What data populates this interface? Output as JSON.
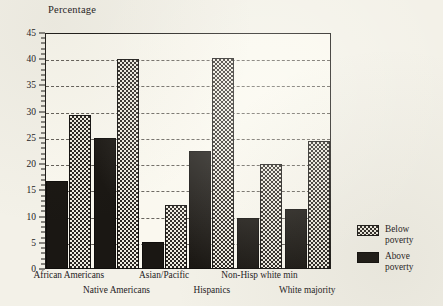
{
  "chart_data": {
    "type": "bar",
    "title": "Percentage",
    "xlabel": "",
    "ylabel": "Percentage",
    "ylim": [
      0,
      45
    ],
    "ytick_step": 5,
    "yticks": [
      0,
      5,
      10,
      15,
      20,
      25,
      30,
      35,
      40,
      45
    ],
    "ytick_labels": [
      "0",
      "5",
      "10",
      "15",
      "20",
      "25",
      "30",
      "35",
      "40",
      "45"
    ],
    "grid": true,
    "grid_style": "dashed-horizontal",
    "legend_position": "right",
    "categories": [
      "African Americans",
      "Native Americans",
      "Asian/Pacific",
      "Hispanics",
      "Non-Hisp white min",
      "White majority"
    ],
    "series": [
      {
        "name": "Above poverty",
        "pattern": "solid-dark",
        "color": "#1a1713",
        "values": [
          16.7,
          25.0,
          5.2,
          22.5,
          9.7,
          11.5
        ]
      },
      {
        "name": "Below poverty",
        "pattern": "checkered",
        "color": "#2a2622",
        "values": [
          29.3,
          40.0,
          12.2,
          40.2,
          20.0,
          24.5
        ]
      }
    ]
  },
  "axis": {
    "y_title": "Percentage"
  },
  "legend": {
    "items": [
      {
        "label_line1": "Below",
        "label_line2": "poverty",
        "swatch": "checkered-swatch"
      },
      {
        "label_line1": "Above",
        "label_line2": "poverty",
        "swatch": "solid-dark-swatch"
      }
    ]
  },
  "colors": {
    "background": "#f3f1e8",
    "plot_background": "#faf8ef",
    "axis": "#1c1a17",
    "text": "#23201c",
    "bar_above": "#1a1713",
    "bar_below_ink": "#2a2622",
    "bar_below_paper": "#efece1"
  }
}
